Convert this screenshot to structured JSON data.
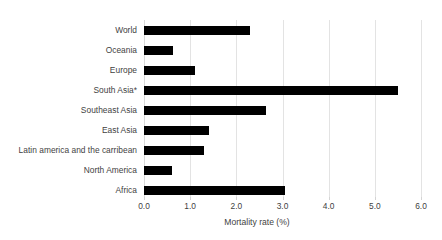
{
  "chart_data": {
    "type": "bar",
    "orientation": "horizontal",
    "title": "",
    "xlabel": "Mortality rate (%)",
    "ylabel": "",
    "xlim": [
      0.0,
      6.0
    ],
    "xticks": [
      "0.0",
      "1.0",
      "2.0",
      "3.0",
      "4.0",
      "5.0",
      "6.0"
    ],
    "xtick_values": [
      0.0,
      1.0,
      2.0,
      3.0,
      4.0,
      5.0,
      6.0
    ],
    "grid": "vertical",
    "legend": "none",
    "bar_color": "#000000",
    "gridline_color": "#e3e3e3",
    "background_color": "#ffffff",
    "categories": [
      "World",
      "Oceania",
      "Europe",
      "South Asia*",
      "Southeast Asia",
      "East Asia",
      "Latin america and the carribean",
      "North America",
      "Africa"
    ],
    "values": [
      2.3,
      0.62,
      1.1,
      5.5,
      2.65,
      1.4,
      1.3,
      0.6,
      3.05
    ]
  }
}
